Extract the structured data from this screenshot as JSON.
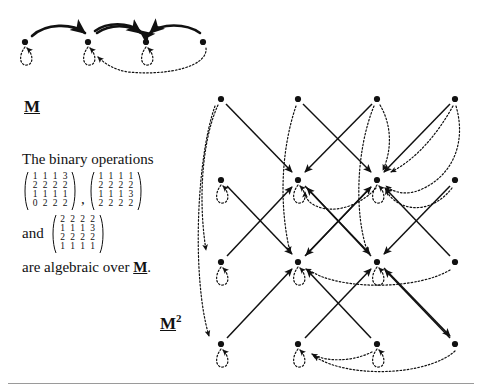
{
  "figure": {
    "title_top": "M",
    "title_bottom": "M",
    "title_bottom_exponent": "2",
    "caption_line1": "The binary operations",
    "caption_connector": "and",
    "caption_line3": "are algebraic over",
    "caption_line3_symbol": "M",
    "caption_line3_end": ".",
    "comma": ",",
    "matrices": [
      {
        "name": "matrix-1",
        "rows": [
          [
            "1",
            "1",
            "1",
            "3"
          ],
          [
            "2",
            "2",
            "2",
            "2"
          ],
          [
            "1",
            "1",
            "1",
            "1"
          ],
          [
            "0",
            "2",
            "2",
            "2"
          ]
        ]
      },
      {
        "name": "matrix-2",
        "rows": [
          [
            "1",
            "1",
            "1",
            "1"
          ],
          [
            "2",
            "2",
            "2",
            "2"
          ],
          [
            "1",
            "1",
            "1",
            "3"
          ],
          [
            "2",
            "2",
            "2",
            "2"
          ]
        ]
      },
      {
        "name": "matrix-3",
        "rows": [
          [
            "2",
            "2",
            "2",
            "2"
          ],
          [
            "1",
            "1",
            "1",
            "3"
          ],
          [
            "2",
            "2",
            "2",
            "2"
          ],
          [
            "1",
            "1",
            "1",
            "1"
          ]
        ]
      }
    ],
    "top_diagram": {
      "name": "monoid-M-graph",
      "node_count": 4,
      "nodes": [
        {
          "id": "m1",
          "x": 25,
          "y": 42
        },
        {
          "id": "m2",
          "x": 88,
          "y": 42
        },
        {
          "id": "m3",
          "x": 146,
          "y": 42
        },
        {
          "id": "m4",
          "x": 203,
          "y": 42
        }
      ],
      "self_loops": [
        "m1",
        "m2",
        "m3"
      ],
      "solid_edges": [
        {
          "from": "m1",
          "to": "m2"
        },
        {
          "from": "m2",
          "to": "m3"
        },
        {
          "from": "m3",
          "to": "m2"
        },
        {
          "from": "m4",
          "to": "m3"
        }
      ],
      "dotted_edges": [
        {
          "from": "m4",
          "to": "m2"
        }
      ]
    },
    "bottom_diagram": {
      "name": "square-M2-graph",
      "grid_rows": 4,
      "grid_cols": 4,
      "node_count": 16,
      "columns_x": [
        221,
        298,
        377,
        455
      ],
      "rows_y": [
        99,
        180,
        262,
        344
      ],
      "self_loop_nodes": [
        "r2c1",
        "r2c2",
        "r2c3",
        "r3c1",
        "r3c2",
        "r3c3",
        "r4c1",
        "r4c2",
        "r4c3"
      ],
      "colors": {
        "ink": "#111111",
        "background": "#ffffff",
        "rule": "#9a9a9a"
      }
    }
  }
}
